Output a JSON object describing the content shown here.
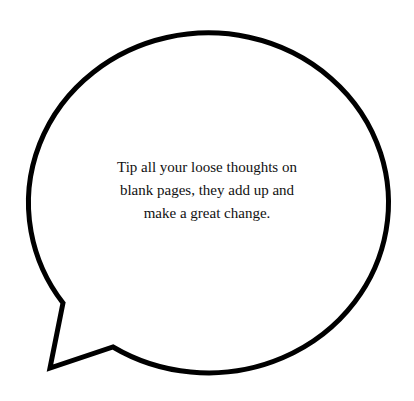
{
  "bubble": {
    "quote": "Tip all your loose thoughts on blank pages, they add up and make a great change.",
    "stroke_color": "#000000",
    "fill_color": "#ffffff"
  }
}
